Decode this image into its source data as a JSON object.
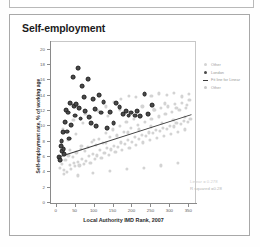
{
  "card": {
    "title": "Self-employment"
  },
  "legend": {
    "items": [
      {
        "label": "Other",
        "symbol": "light-gray-dot"
      },
      {
        "label": "London",
        "symbol": "dark-dot"
      },
      {
        "label": "Fit line for Linear",
        "symbol": "trend-line"
      },
      {
        "label": "Other",
        "symbol": "light-gray-dot"
      }
    ]
  },
  "annotations": {
    "line1": "Linear = 0.278",
    "line2": "R squared =0.28"
  },
  "chart_data": {
    "type": "scatter",
    "title": "Self-employment",
    "xlabel": "Local Authority IMD Rank, 2007",
    "ylabel": "Self-employment rate, % of working age",
    "xlim": [
      -15,
      365
    ],
    "ylim": [
      0,
      21
    ],
    "xticks": [
      0,
      50,
      100,
      150,
      200,
      250,
      300,
      350
    ],
    "yticks": [
      0,
      2,
      4,
      6,
      8,
      10,
      12,
      14,
      16,
      18,
      20
    ],
    "grid": false,
    "legend_position": "right",
    "trendline": {
      "x0": 0,
      "y0": 6.0,
      "x1": 355,
      "y1": 11.6,
      "r_squared": 0.28
    },
    "series": [
      {
        "name": "Other",
        "color": "#d3d3d3",
        "points": [
          [
            8,
            4.6
          ],
          [
            14,
            5.1
          ],
          [
            19,
            4.3
          ],
          [
            23,
            5.6
          ],
          [
            27,
            4.1
          ],
          [
            31,
            6.2
          ],
          [
            34,
            5.0
          ],
          [
            38,
            4.5
          ],
          [
            42,
            6.0
          ],
          [
            45,
            5.2
          ],
          [
            49,
            4.8
          ],
          [
            52,
            6.6
          ],
          [
            56,
            5.4
          ],
          [
            60,
            4.9
          ],
          [
            63,
            7.1
          ],
          [
            67,
            5.8
          ],
          [
            71,
            5.1
          ],
          [
            74,
            6.8
          ],
          [
            78,
            5.5
          ],
          [
            82,
            7.3
          ],
          [
            85,
            6.1
          ],
          [
            89,
            5.2
          ],
          [
            93,
            8.0
          ],
          [
            96,
            6.4
          ],
          [
            100,
            5.7
          ],
          [
            104,
            7.6
          ],
          [
            107,
            6.2
          ],
          [
            111,
            8.4
          ],
          [
            115,
            6.9
          ],
          [
            118,
            5.9
          ],
          [
            122,
            7.8
          ],
          [
            126,
            6.5
          ],
          [
            129,
            9.1
          ],
          [
            133,
            7.2
          ],
          [
            137,
            6.3
          ],
          [
            140,
            8.6
          ],
          [
            144,
            7.0
          ],
          [
            148,
            9.6
          ],
          [
            151,
            7.5
          ],
          [
            155,
            6.7
          ],
          [
            159,
            8.9
          ],
          [
            162,
            7.3
          ],
          [
            166,
            10.1
          ],
          [
            170,
            7.9
          ],
          [
            173,
            6.9
          ],
          [
            177,
            9.3
          ],
          [
            181,
            7.7
          ],
          [
            184,
            10.6
          ],
          [
            188,
            8.2
          ],
          [
            192,
            7.2
          ],
          [
            195,
            9.8
          ],
          [
            199,
            8.0
          ],
          [
            203,
            11.0
          ],
          [
            206,
            8.6
          ],
          [
            210,
            7.6
          ],
          [
            214,
            10.2
          ],
          [
            217,
            8.4
          ],
          [
            221,
            11.4
          ],
          [
            225,
            8.9
          ],
          [
            228,
            7.9
          ],
          [
            232,
            10.6
          ],
          [
            236,
            8.8
          ],
          [
            239,
            11.8
          ],
          [
            243,
            9.2
          ],
          [
            247,
            8.2
          ],
          [
            250,
            11.0
          ],
          [
            254,
            9.1
          ],
          [
            258,
            12.1
          ],
          [
            261,
            9.5
          ],
          [
            265,
            8.5
          ],
          [
            269,
            11.3
          ],
          [
            272,
            9.4
          ],
          [
            276,
            12.4
          ],
          [
            280,
            9.8
          ],
          [
            283,
            8.8
          ],
          [
            287,
            11.6
          ],
          [
            291,
            9.7
          ],
          [
            294,
            12.6
          ],
          [
            298,
            10.1
          ],
          [
            302,
            9.0
          ],
          [
            305,
            11.9
          ],
          [
            309,
            10.0
          ],
          [
            313,
            12.9
          ],
          [
            316,
            10.4
          ],
          [
            320,
            9.3
          ],
          [
            324,
            12.1
          ],
          [
            327,
            10.3
          ],
          [
            331,
            13.1
          ],
          [
            335,
            10.7
          ],
          [
            338,
            9.6
          ],
          [
            342,
            12.4
          ],
          [
            346,
            10.6
          ],
          [
            350,
            13.4
          ],
          [
            353,
            11.0
          ],
          [
            12,
            7.4
          ],
          [
            30,
            8.2
          ],
          [
            50,
            9.0
          ],
          [
            70,
            10.4
          ],
          [
            90,
            11.2
          ],
          [
            110,
            12.0
          ],
          [
            130,
            12.6
          ],
          [
            150,
            13.2
          ],
          [
            170,
            13.6
          ],
          [
            190,
            14.0
          ],
          [
            210,
            13.8
          ],
          [
            230,
            14.2
          ],
          [
            250,
            14.0
          ],
          [
            270,
            14.3
          ],
          [
            290,
            14.1
          ],
          [
            310,
            14.4
          ],
          [
            330,
            13.9
          ],
          [
            348,
            14.2
          ],
          [
            20,
            3.8
          ],
          [
            55,
            3.6
          ],
          [
            95,
            3.9
          ],
          [
            140,
            4.2
          ],
          [
            185,
            4.4
          ],
          [
            230,
            4.6
          ],
          [
            275,
            4.9
          ],
          [
            320,
            5.2
          ],
          [
            16,
            9.6
          ],
          [
            44,
            10.8
          ],
          [
            76,
            11.6
          ],
          [
            106,
            10.2
          ],
          [
            136,
            11.4
          ],
          [
            166,
            12.2
          ],
          [
            196,
            11.8
          ],
          [
            226,
            12.6
          ],
          [
            256,
            12.2
          ],
          [
            286,
            13.0
          ],
          [
            316,
            12.4
          ],
          [
            344,
            12.8
          ],
          [
            35,
            6.9
          ],
          [
            65,
            7.4
          ],
          [
            99,
            8.2
          ],
          [
            129,
            7.8
          ],
          [
            158,
            8.8
          ],
          [
            188,
            9.2
          ],
          [
            218,
            9.6
          ],
          [
            248,
            10.0
          ],
          [
            278,
            10.4
          ],
          [
            308,
            10.8
          ],
          [
            338,
            11.2
          ]
        ]
      },
      {
        "name": "London",
        "color": "#4a4a4a",
        "points": [
          [
            6,
            6.0
          ],
          [
            9,
            5.6
          ],
          [
            11,
            7.4
          ],
          [
            13,
            8.1
          ],
          [
            15,
            6.8
          ],
          [
            17,
            9.2
          ],
          [
            18,
            7.0
          ],
          [
            20,
            6.4
          ],
          [
            22,
            10.6
          ],
          [
            25,
            12.1
          ],
          [
            28,
            9.3
          ],
          [
            31,
            11.8
          ],
          [
            33,
            8.4
          ],
          [
            36,
            13.0
          ],
          [
            38,
            10.2
          ],
          [
            43,
            16.4
          ],
          [
            46,
            12.6
          ],
          [
            48,
            11.4
          ],
          [
            52,
            12.9
          ],
          [
            57,
            17.6
          ],
          [
            60,
            12.4
          ],
          [
            63,
            11.0
          ],
          [
            68,
            15.2
          ],
          [
            72,
            13.8
          ],
          [
            76,
            12.0
          ],
          [
            82,
            16.2
          ],
          [
            86,
            11.2
          ],
          [
            91,
            10.4
          ],
          [
            96,
            13.6
          ],
          [
            101,
            12.2
          ],
          [
            105,
            10.0
          ],
          [
            112,
            14.1
          ],
          [
            118,
            11.8
          ],
          [
            124,
            13.2
          ],
          [
            132,
            9.8
          ],
          [
            141,
            11.9
          ],
          [
            150,
            10.4
          ],
          [
            157,
            13.0
          ],
          [
            166,
            12.5
          ],
          [
            175,
            11.6
          ],
          [
            183,
            12.0
          ],
          [
            190,
            11.4
          ],
          [
            197,
            11.8
          ],
          [
            206,
            11.4
          ],
          [
            212,
            12.0
          ],
          [
            221,
            11.3
          ],
          [
            232,
            14.2
          ],
          [
            241,
            11.6
          ],
          [
            252,
            12.8
          ]
        ]
      }
    ]
  }
}
